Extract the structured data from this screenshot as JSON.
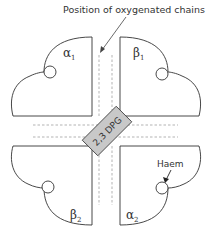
{
  "title": "Position of oxygenated chains",
  "center_label": "2,3 DPG",
  "haem_label": "Haem",
  "subunits": [
    {
      "id": "alpha1",
      "symbol": "α",
      "subscript": "1"
    },
    {
      "id": "beta1",
      "symbol": "β",
      "subscript": "1"
    },
    {
      "id": "beta2",
      "symbol": "β",
      "subscript": "2"
    },
    {
      "id": "alpha2",
      "symbol": "α",
      "subscript": "2"
    }
  ],
  "colors": {
    "stroke": "#333333",
    "dashed": "#aaaaaa",
    "dpg_fill": "#c8c8c8"
  }
}
